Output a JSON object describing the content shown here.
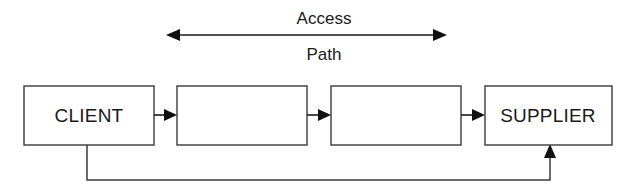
{
  "diagram": {
    "span_label": {
      "line1": "Access",
      "line2": "Path"
    },
    "nodes": [
      {
        "id": "client",
        "label": "CLIENT",
        "x": 24,
        "y": 86,
        "w": 130,
        "h": 59
      },
      {
        "id": "stage-1",
        "label": "",
        "x": 177,
        "y": 86,
        "w": 130,
        "h": 59
      },
      {
        "id": "stage-2",
        "label": "",
        "x": 331,
        "y": 86,
        "w": 130,
        "h": 59
      },
      {
        "id": "supplier",
        "label": "SUPPLIER",
        "x": 485,
        "y": 86,
        "w": 127,
        "h": 59
      }
    ],
    "connectors": [
      {
        "id": "client-to-stage-1",
        "from": "client",
        "to": "stage-1",
        "direction": "right"
      },
      {
        "id": "stage-1-to-stage-2",
        "from": "stage-1",
        "to": "stage-2",
        "direction": "right"
      },
      {
        "id": "stage-2-to-supplier",
        "from": "stage-2",
        "to": "supplier",
        "direction": "right"
      }
    ],
    "span_arrow": {
      "id": "access-path-span",
      "x_start": 166,
      "x_end": 447,
      "y": 35,
      "double_headed": true
    },
    "feedback": {
      "id": "supplier-feedback",
      "from": "client",
      "to": "supplier",
      "drop_x": 87,
      "bottom_y": 180,
      "rise_x": 550
    },
    "colors": {
      "background": "#ffffff",
      "stroke": "#3a3a3a",
      "arrow": "#111111",
      "text": "#1a1a1a"
    }
  }
}
